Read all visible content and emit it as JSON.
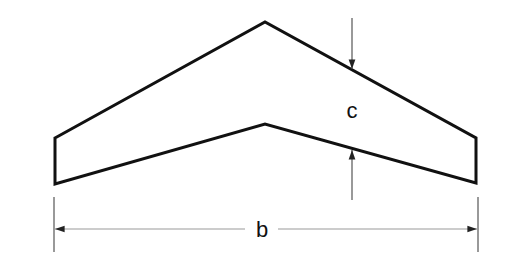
{
  "diagram": {
    "labels": {
      "chord": "c",
      "span": "b"
    },
    "colors": {
      "outline": "#111111",
      "dimension": "#555555",
      "background": "#ffffff"
    }
  }
}
